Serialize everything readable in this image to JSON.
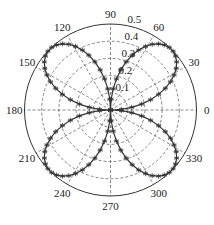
{
  "chart_data": {
    "type": "polar_line",
    "title": "",
    "function": "r = 0.5 * |sin(2θ)|",
    "radial_axis": {
      "range": [
        0,
        0.5
      ],
      "ticks": [
        0.1,
        0.2,
        0.3,
        0.4,
        0.5
      ],
      "tick_labels": [
        "0.1",
        "0.2",
        "0.3",
        "0.4",
        "0.5"
      ],
      "grid": "dashed circles"
    },
    "angular_axis": {
      "unit": "degrees",
      "ticks": [
        0,
        30,
        60,
        90,
        120,
        150,
        180,
        210,
        240,
        270,
        300,
        330
      ],
      "tick_labels": [
        "0",
        "30",
        "60",
        "90",
        "120",
        "150",
        "180",
        "210",
        "240",
        "270",
        "300",
        "330"
      ],
      "grid": "dashed spokes"
    },
    "series": [
      {
        "name": "rose",
        "marker": "*",
        "line": "solid",
        "color": "#333333",
        "theta_step_deg": 3.6,
        "sample_points": [
          {
            "theta": 0,
            "r": 0.0
          },
          {
            "theta": 22.5,
            "r": 0.354
          },
          {
            "theta": 45,
            "r": 0.5
          },
          {
            "theta": 67.5,
            "r": 0.354
          },
          {
            "theta": 90,
            "r": 0.0
          },
          {
            "theta": 135,
            "r": 0.5
          },
          {
            "theta": 180,
            "r": 0.0
          },
          {
            "theta": 225,
            "r": 0.5
          },
          {
            "theta": 270,
            "r": 0.0
          },
          {
            "theta": 315,
            "r": 0.5
          }
        ]
      }
    ],
    "legend": null
  },
  "layout": {
    "cx": 110.5,
    "cy": 110,
    "radius": 86,
    "grid_color": "#555555",
    "line_color": "#333333"
  }
}
